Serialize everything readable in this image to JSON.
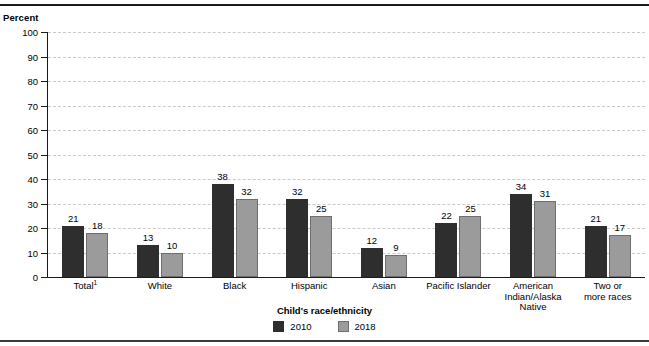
{
  "figure": {
    "y_axis_title": "Percent",
    "ghost_header": "",
    "legend_title": "Child's race/ethnicity"
  },
  "chart_data": {
    "type": "bar",
    "title": "",
    "xlabel": "Child's race/ethnicity",
    "ylabel": "Percent",
    "ylim": [
      0,
      100
    ],
    "yticks": [
      0,
      10,
      20,
      30,
      40,
      50,
      60,
      70,
      80,
      90,
      100
    ],
    "grid": true,
    "legend_position": "bottom-center",
    "categories": [
      "Total¹",
      "White",
      "Black",
      "Hispanic",
      "Asian",
      "Pacific Islander",
      "American Indian/Alaska Native",
      "Two or more races"
    ],
    "category_lines": [
      [
        "Total",
        "1"
      ],
      [
        "White"
      ],
      [
        "Black"
      ],
      [
        "Hispanic"
      ],
      [
        "Asian"
      ],
      [
        "Pacific Islander"
      ],
      [
        "American",
        "Indian/Alaska",
        "Native"
      ],
      [
        "Two or",
        "more races"
      ]
    ],
    "series": [
      {
        "name": "2010",
        "color": "#2e2e2e",
        "values": [
          21,
          13,
          38,
          32,
          12,
          22,
          34,
          21
        ]
      },
      {
        "name": "2018",
        "color": "#9b9b9b",
        "values": [
          18,
          10,
          32,
          25,
          9,
          25,
          31,
          17
        ]
      }
    ]
  }
}
